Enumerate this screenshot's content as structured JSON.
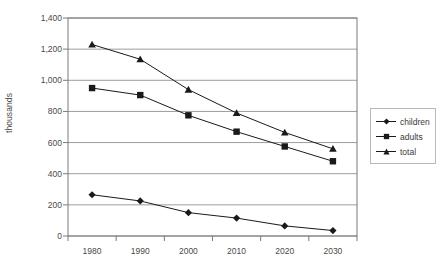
{
  "chart_data": {
    "type": "line",
    "title": "",
    "xlabel": "",
    "ylabel": "thousands",
    "categories": [
      "1980",
      "1990",
      "2000",
      "2010",
      "2020",
      "2030"
    ],
    "x": [
      1980,
      1990,
      2000,
      2010,
      2020,
      2030
    ],
    "series": [
      {
        "name": "children",
        "marker": "diamond",
        "color": "#1a1a1a",
        "values": [
          265,
          225,
          150,
          115,
          65,
          35
        ]
      },
      {
        "name": "adults",
        "marker": "square",
        "color": "#1a1a1a",
        "values": [
          950,
          905,
          775,
          670,
          575,
          480
        ]
      },
      {
        "name": "total",
        "marker": "triangle",
        "color": "#1a1a1a",
        "values": [
          1230,
          1135,
          940,
          790,
          665,
          560
        ]
      }
    ],
    "ylim": [
      0,
      1400
    ],
    "ytick_values": [
      0,
      200,
      400,
      600,
      800,
      1000,
      1200,
      1400
    ],
    "ytick_labels": [
      "0",
      "200",
      "400",
      "600",
      "800",
      "1,000",
      "1,200",
      "1,400"
    ],
    "grid": true,
    "grid_axis": "y",
    "legend_position": "right",
    "legend_entries": [
      "children",
      "adults",
      "total"
    ],
    "colors": {
      "line": "#1a1a1a",
      "grid": "#9c9c9c",
      "axis": "#7a7a7a",
      "text": "#4a4a4a",
      "background": "#ffffff"
    }
  }
}
